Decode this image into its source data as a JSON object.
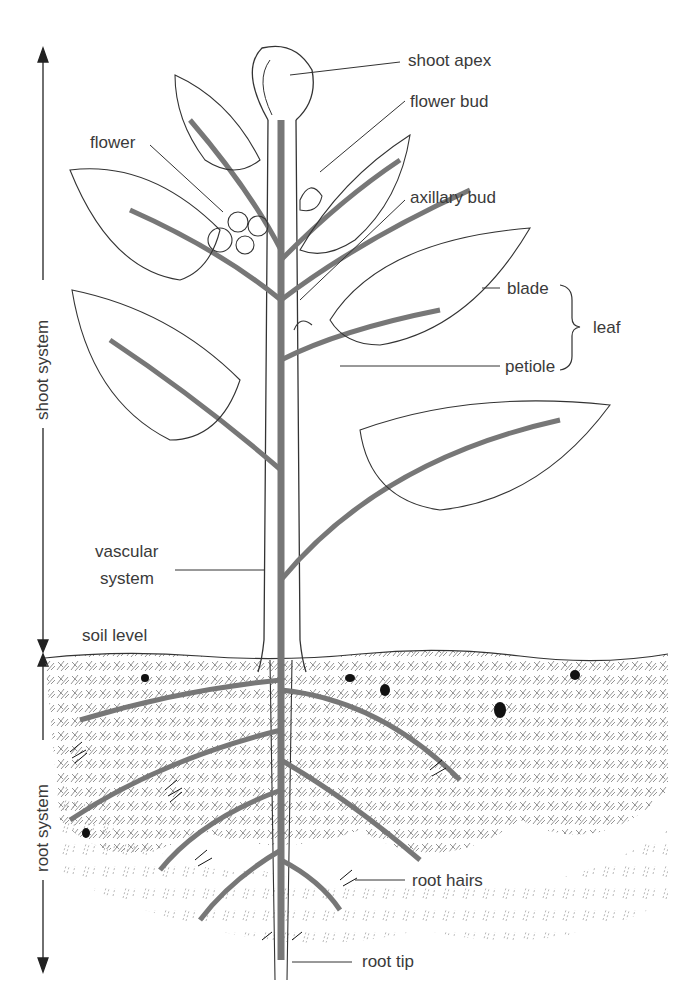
{
  "diagram": {
    "labels": {
      "shoot_apex": "shoot apex",
      "flower_bud": "flower bud",
      "flower": "flower",
      "axillary_bud": "axillary bud",
      "blade": "blade",
      "petiole": "petiole",
      "leaf": "leaf",
      "vascular_system_line1": "vascular",
      "vascular_system_line2": "system",
      "soil_level": "soil level",
      "root_hairs": "root hairs",
      "root_tip": "root tip",
      "shoot_system": "shoot system",
      "root_system": "root system"
    },
    "colors": {
      "line": "#333333",
      "stem_vascular": "#777777",
      "background": "#ffffff",
      "soil_hatch": "#555555"
    }
  }
}
